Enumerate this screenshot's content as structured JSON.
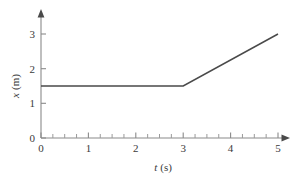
{
  "chart_data": {
    "type": "line",
    "title": "",
    "subtitle": "",
    "xlabel": "t (s)",
    "ylabel": "x (m)",
    "xlabel_symbol": "t",
    "xlabel_unit": "(s)",
    "ylabel_symbol": "x",
    "ylabel_unit": "(m)",
    "xlim": [
      0,
      5
    ],
    "ylim": [
      0,
      3.15
    ],
    "x_ticks": [
      0,
      1,
      2,
      3,
      4,
      5
    ],
    "x_tick_labels": [
      "0",
      "1",
      "2",
      "3",
      "4",
      "5"
    ],
    "x_minor_tick_interval": 0.25,
    "y_ticks": [
      0,
      1,
      2,
      3
    ],
    "y_tick_labels": [
      "0",
      "1",
      "2",
      "3"
    ],
    "y_minor_ticks": [],
    "grid": false,
    "legend": false,
    "legend_position": "none",
    "axis_style": "arrow-ended",
    "line_color": "#4a4a4a",
    "axis_color": "#8a8a8a",
    "series": [
      {
        "name": "position",
        "x": [
          0,
          3,
          5
        ],
        "values": [
          1.5,
          1.5,
          3.0
        ],
        "points": [
          {
            "t": 0,
            "x": 1.5
          },
          {
            "t": 3,
            "x": 1.5
          },
          {
            "t": 5,
            "x": 3.0
          }
        ],
        "description": "constant at 1.5 m from t=0 s to t=3 s, then increases linearly to 3.0 m at t=5 s"
      }
    ],
    "annotations": []
  },
  "axes": {
    "x_title": "t (s)",
    "y_title": "x (m)"
  }
}
